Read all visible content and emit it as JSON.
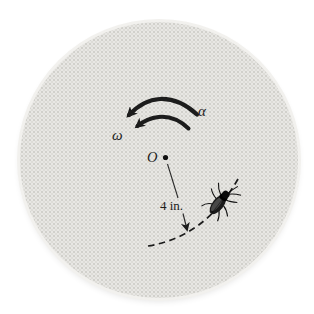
{
  "diagram": {
    "labels": {
      "alpha": "α",
      "omega": "ω",
      "center": "O",
      "radius": "4 in."
    },
    "colors": {
      "background": "#ffffff",
      "disk_fill": "#e8e7e4",
      "disk_texture_dot": "#d0cfcb",
      "disk_rim": "#f2f1ee",
      "ink": "#1c1c1c"
    }
  }
}
